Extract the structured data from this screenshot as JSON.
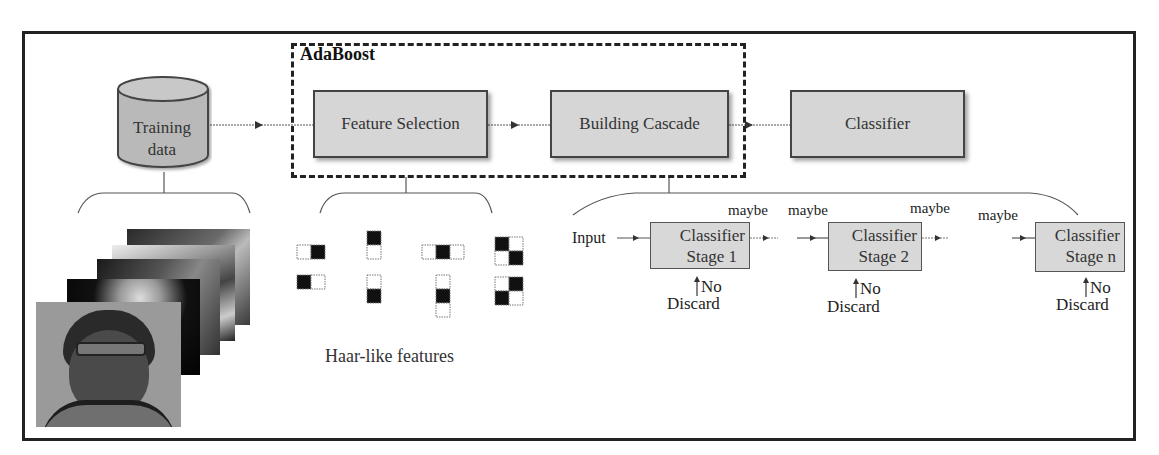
{
  "diagram": {
    "adaboost_group": {
      "label": "AdaBoost"
    },
    "nodes": {
      "training_data": {
        "label_line1": "Training",
        "label_line2": "data",
        "shape": "cylinder"
      },
      "feature_selection": {
        "label": "Feature Selection"
      },
      "building_cascade": {
        "label": "Building Cascade"
      },
      "classifier": {
        "label": "Classifier"
      }
    },
    "haar": {
      "caption": "Haar-like features",
      "count": 8
    },
    "cascade": {
      "input_label": "Input",
      "stages": [
        {
          "line1": "Classifier",
          "line2": "Stage 1",
          "reject_label": "No",
          "discard_label": "Discard"
        },
        {
          "line1": "Classifier",
          "line2": "Stage 2",
          "reject_label": "No",
          "discard_label": "Discard"
        },
        {
          "line1": "Classifier",
          "line2": "Stage n",
          "reject_label": "No",
          "discard_label": "Discard"
        }
      ],
      "maybe_labels": [
        "maybe",
        "maybe",
        "maybe",
        "maybe"
      ]
    },
    "face_stack": {
      "count": 5
    },
    "colors": {
      "box_fill": "#d6d6d6",
      "border": "#222222",
      "haar_dark": "#111111",
      "haar_light": "#ffffff"
    }
  }
}
